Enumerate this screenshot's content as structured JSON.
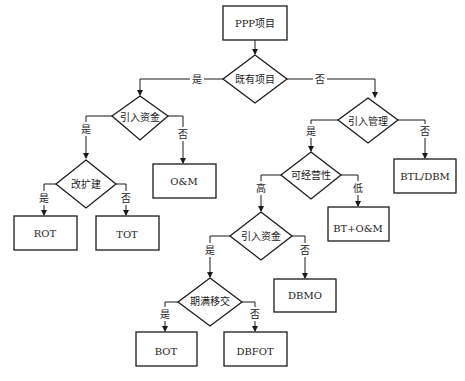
{
  "diagram": {
    "title": "PPP项目",
    "nodes": {
      "root": "PPP项目",
      "existing": "既有项目",
      "funds1": "引入资金",
      "expand": "改扩建",
      "rot": "ROT",
      "tot": "TOT",
      "om": "O&M",
      "mgmt": "引入管理",
      "btl": "BTL/DBM",
      "viability": "可经营性",
      "btom": "BT+O&M",
      "funds2": "引入资金",
      "dbmo": "DBMO",
      "transfer": "期满移交",
      "bot": "BOT",
      "dbfot": "DBFOT"
    },
    "edge_labels": {
      "yes": "是",
      "no": "否",
      "high": "高",
      "low": "低"
    }
  }
}
